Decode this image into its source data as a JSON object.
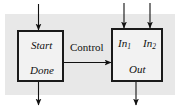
{
  "figure": {
    "background_color": "#e8e8e8",
    "box_fill": "#f2f2f2",
    "stroke_color": "#1a1a1a"
  },
  "blocks": [
    {
      "id": "start-done-block",
      "top_label": "Start",
      "bottom_label": "Done"
    },
    {
      "id": "function-block",
      "input_label_1": "In",
      "input_sub_1": "1",
      "input_label_2": "In",
      "input_sub_2": "2",
      "output_label": "Out"
    }
  ],
  "connector": {
    "label": "Control"
  },
  "arrows": [
    {
      "name": "arrow-into-start",
      "direction": "down"
    },
    {
      "name": "arrow-out-of-done",
      "direction": "down"
    },
    {
      "name": "arrow-into-in1",
      "direction": "down"
    },
    {
      "name": "arrow-into-in2",
      "direction": "down"
    },
    {
      "name": "arrow-control-to-function",
      "direction": "right"
    },
    {
      "name": "arrow-out-of-out",
      "direction": "down"
    }
  ]
}
